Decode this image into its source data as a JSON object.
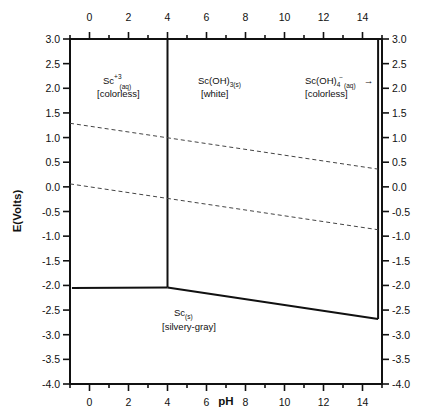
{
  "chart_data": {
    "type": "line",
    "title": "",
    "xlabel": "pH",
    "ylabel": "E(Volts)",
    "xlim": [
      -1,
      15
    ],
    "ylim": [
      -4.0,
      3.0
    ],
    "x_ticks": [
      0,
      2,
      4,
      6,
      8,
      10,
      12,
      14
    ],
    "x_tick_labels": [
      "0",
      "2",
      "4",
      "6",
      "8",
      "10",
      "12",
      "14"
    ],
    "y_ticks": [
      3.0,
      2.5,
      2.0,
      1.5,
      1.0,
      0.5,
      0.0,
      -0.5,
      -1.0,
      -1.5,
      -2.0,
      -2.5,
      -3.0,
      -3.5,
      -4.0
    ],
    "y_tick_labels": [
      "3.0",
      "2.5",
      "2.0",
      "1.5",
      "1.0",
      "0.5",
      "0.0",
      "-0.5",
      "-1.0",
      "-1.5",
      "-2.0",
      "-2.5",
      "-3.0",
      "-3.5",
      "-4.0"
    ],
    "grid": false,
    "mirror_axes": true,
    "series": [
      {
        "name": "Sc3+/Sc(s) boundary",
        "style": "solid",
        "x": [
          -0.9,
          4.0
        ],
        "y": [
          -2.05,
          -2.04
        ]
      },
      {
        "name": "Sc3+/Sc(OH)3 boundary",
        "style": "solid",
        "x": [
          4.0,
          4.0
        ],
        "y": [
          -2.04,
          3.0
        ]
      },
      {
        "name": "Sc(OH)3/Sc(s) boundary",
        "style": "solid",
        "x": [
          4.0,
          14.8
        ],
        "y": [
          -2.04,
          -2.68
        ]
      },
      {
        "name": "Sc(OH)3/Sc(OH)4- boundary",
        "style": "solid",
        "x": [
          14.8,
          14.8
        ],
        "y": [
          -2.68,
          3.0
        ]
      },
      {
        "name": "O2/H2O line",
        "style": "dashed",
        "x": [
          -1,
          14.8
        ],
        "y": [
          1.29,
          0.36
        ]
      },
      {
        "name": "H+/H2 line",
        "style": "dashed",
        "x": [
          -1,
          14.8
        ],
        "y": [
          0.06,
          -0.87
        ]
      }
    ],
    "annotations": [
      {
        "species": "Sc+3(aq)",
        "color": "[colorless]",
        "x": 1.3,
        "y": 2.1
      },
      {
        "species": "Sc(OH)3(s)",
        "color": "[white]",
        "x": 7.1,
        "y": 2.1
      },
      {
        "species": "Sc(OH)4-(aq) →",
        "color": "[colorless]",
        "x": 12.3,
        "y": 2.1
      },
      {
        "species": "Sc(s)",
        "color": "[silvery-gray]",
        "x": 6.3,
        "y": -3.0
      }
    ]
  },
  "labels": {
    "xlabel": "pH",
    "ylabel": "E(Volts)",
    "sc3": {
      "main": "Sc",
      "sup": "+3",
      "sub": "(aq)",
      "color": "[colorless]"
    },
    "scoh3": {
      "main": "Sc(OH)",
      "sub": "3(s)",
      "color": "[white]"
    },
    "scoh4": {
      "main": "Sc(OH)",
      "sub": "4",
      "sup": "−",
      "sub2": "(aq)",
      "arrow": "→",
      "color": "[colorless]"
    },
    "scs": {
      "main": "Sc",
      "sub": "(s)",
      "color": "[silvery-gray]"
    }
  }
}
